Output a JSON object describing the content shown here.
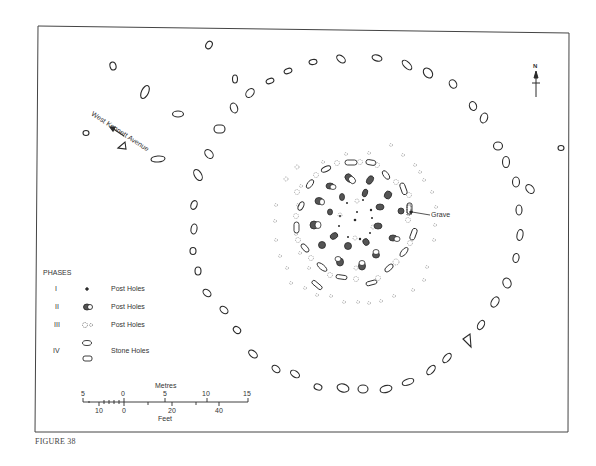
{
  "figure": {
    "caption": "FIGURE 38",
    "frame": {
      "x": 38,
      "y": 27,
      "w": 230,
      "h": 0
    }
  },
  "labels": {
    "avenue": "West Kennett Avenue",
    "grave": "Grave",
    "north": "N"
  },
  "legend": {
    "title": "PHASES",
    "rows": [
      {
        "phase": "I",
        "symbol": "small-dot",
        "label": "Post Holes"
      },
      {
        "phase": "II",
        "symbol": "shaded-double-oval",
        "label": "Post Holes"
      },
      {
        "phase": "III",
        "symbol": "dotted-circles",
        "label": "Post Holes"
      },
      {
        "phase": "IV",
        "symbol": "oval-and-rounded-rect",
        "label": "Stone Holes"
      }
    ]
  },
  "scale_bar": {
    "metres_label": "Metres",
    "metres_ticks": [
      "5",
      "0",
      "5",
      "10",
      "15"
    ],
    "feet_label": "Feet",
    "feet_ticks": [
      "10",
      "0",
      "20",
      "40"
    ]
  },
  "colors": {
    "ink": "#2a2a2a",
    "faint": "#9a9a9a",
    "shade": "#555555",
    "paper": "#ffffff"
  }
}
